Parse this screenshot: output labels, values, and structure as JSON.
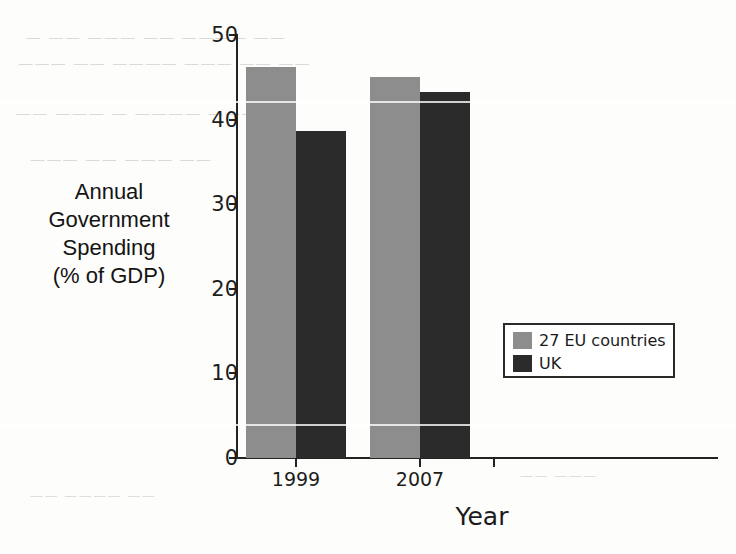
{
  "chart_data": {
    "type": "bar",
    "title": "",
    "categories": [
      "1999",
      "2007"
    ],
    "series": [
      {
        "name": "27 EU countries",
        "color": "#8d8d8d",
        "values": [
          46.2,
          45.0
        ]
      },
      {
        "name": "UK",
        "color": "#2b2b2b",
        "values": [
          38.6,
          43.3
        ]
      }
    ],
    "xlabel": "Year",
    "ylabel": "Annual Government Spending (% of GDP)",
    "ylim": [
      0,
      50
    ],
    "ytick_labels": [
      "50",
      "40",
      "30",
      "20",
      "10",
      "0"
    ],
    "ytick_values": [
      50,
      40,
      30,
      20,
      10,
      0
    ],
    "grid": false,
    "legend_position": "center-right"
  },
  "yaxis": {
    "title_lines": [
      "Annual",
      "Government",
      "Spending",
      "(% of GDP)"
    ],
    "ticks": [
      {
        "label": "50",
        "value": 50
      },
      {
        "label": "40",
        "value": 40
      },
      {
        "label": "30",
        "value": 30
      },
      {
        "label": "20",
        "value": 20
      },
      {
        "label": "10",
        "value": 10
      },
      {
        "label": "0",
        "value": 0
      }
    ]
  },
  "xaxis": {
    "title": "Year",
    "categories": [
      {
        "label": "1999"
      },
      {
        "label": "2007"
      }
    ]
  },
  "legend": {
    "entries": [
      {
        "label": "27 EU countries",
        "color": "#8d8d8d"
      },
      {
        "label": "UK",
        "color": "#2b2b2b"
      }
    ]
  },
  "bars": [
    {
      "name": "bar-1999-eu",
      "series": "27 EU countries",
      "category": "1999",
      "value": 46.2
    },
    {
      "name": "bar-1999-uk",
      "series": "UK",
      "category": "1999",
      "value": 38.6
    },
    {
      "name": "bar-2007-eu",
      "series": "27 EU countries",
      "category": "2007",
      "value": 45.0
    },
    {
      "name": "bar-2007-uk",
      "series": "UK",
      "category": "2007",
      "value": 43.3
    }
  ],
  "background_bleed": {
    "lines": [
      "—  ——  ———  —— ————  ——",
      "———  ——  ————  ———  ——  ——",
      "——  ———  —  ————  ———",
      "———  ——  ———  ——",
      "——  ———",
      "——  ————  ——"
    ]
  }
}
